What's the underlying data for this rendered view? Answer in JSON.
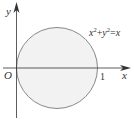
{
  "diagram": {
    "type": "coordinate-plot",
    "axes": {
      "x_label": "x",
      "y_label": "y",
      "origin_label": "O",
      "x_tick_label": "1"
    },
    "curve": {
      "equation_base_x": "x",
      "equation_exp_x": "2",
      "equation_plus": "+",
      "equation_base_y": "y",
      "equation_exp_y": "2",
      "equation_eq": "=",
      "equation_rhs": "x",
      "equation_full": "x^2+y^2=x",
      "shape": "circle",
      "center": [
        0.5,
        0
      ],
      "radius": 0.5
    },
    "colors": {
      "fill": "#f2f2f2",
      "stroke": "#777777",
      "axis": "#333333",
      "text": "#333333"
    }
  }
}
